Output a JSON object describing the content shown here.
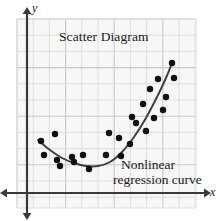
{
  "figure": {
    "type": "scatter-with-regression-curve",
    "width": 223,
    "height": 221,
    "background": "#ffffff"
  },
  "labels": {
    "title": "Scatter Diagram",
    "curve_line1": "Nonlinear",
    "curve_line2": "regression curve",
    "axis_x": "x",
    "axis_y": "y"
  },
  "colors": {
    "plot_background": "#f7f7f7",
    "grid_line": "#d6d6d6",
    "grid_line_major": "#c8c8c8",
    "axis": "#3a3a3a",
    "point": "#111111",
    "curve": "#3d3d3d",
    "text": "#1a1a1a"
  },
  "plot_area": {
    "left": 17,
    "top": 19,
    "right": 196,
    "bottom": 208,
    "grid_step": 16.2,
    "grid_origin_x": 17,
    "grid_origin_y": 19
  },
  "axes": {
    "y_axis": {
      "x": 27,
      "top": 12,
      "bottom": 216,
      "arrow_up": true,
      "arrow_down": true
    },
    "x_axis": {
      "y": 193,
      "left": 6,
      "right": 209,
      "arrow_right": true,
      "arrow_left": true
    }
  },
  "chart_data": {
    "type": "scatter",
    "title": "Scatter Diagram",
    "xlabel": "x",
    "ylabel": "y",
    "grid": true,
    "legend": null,
    "annotations": [
      {
        "text": "Scatter Diagram",
        "px": 59,
        "py": 29
      },
      {
        "text": "Nonlinear regression curve",
        "px": 121,
        "py": 157
      }
    ],
    "point_radius_px": 3.2,
    "note": "Coordinates are in screenshot pixel space; y increases downward.",
    "points_px": [
      [
        41,
        141
      ],
      [
        44,
        155
      ],
      [
        55,
        134
      ],
      [
        57,
        160
      ],
      [
        60,
        166
      ],
      [
        72,
        157
      ],
      [
        74,
        162
      ],
      [
        83,
        155
      ],
      [
        89,
        169
      ],
      [
        106,
        155
      ],
      [
        109,
        133
      ],
      [
        119,
        138
      ],
      [
        121,
        156
      ],
      [
        130,
        144
      ],
      [
        132,
        117
      ],
      [
        136,
        123
      ],
      [
        143,
        104
      ],
      [
        146,
        131
      ],
      [
        150,
        89
      ],
      [
        154,
        118
      ],
      [
        158,
        79
      ],
      [
        163,
        110
      ],
      [
        166,
        97
      ],
      [
        174,
        78
      ],
      [
        172,
        63
      ]
    ],
    "curve_px": [
      [
        38,
        140
      ],
      [
        50,
        150
      ],
      [
        62,
        158
      ],
      [
        74,
        163
      ],
      [
        86,
        166
      ],
      [
        98,
        166
      ],
      [
        110,
        162
      ],
      [
        122,
        152
      ],
      [
        134,
        137
      ],
      [
        146,
        118
      ],
      [
        158,
        95
      ],
      [
        166,
        78
      ],
      [
        172,
        63
      ]
    ]
  }
}
